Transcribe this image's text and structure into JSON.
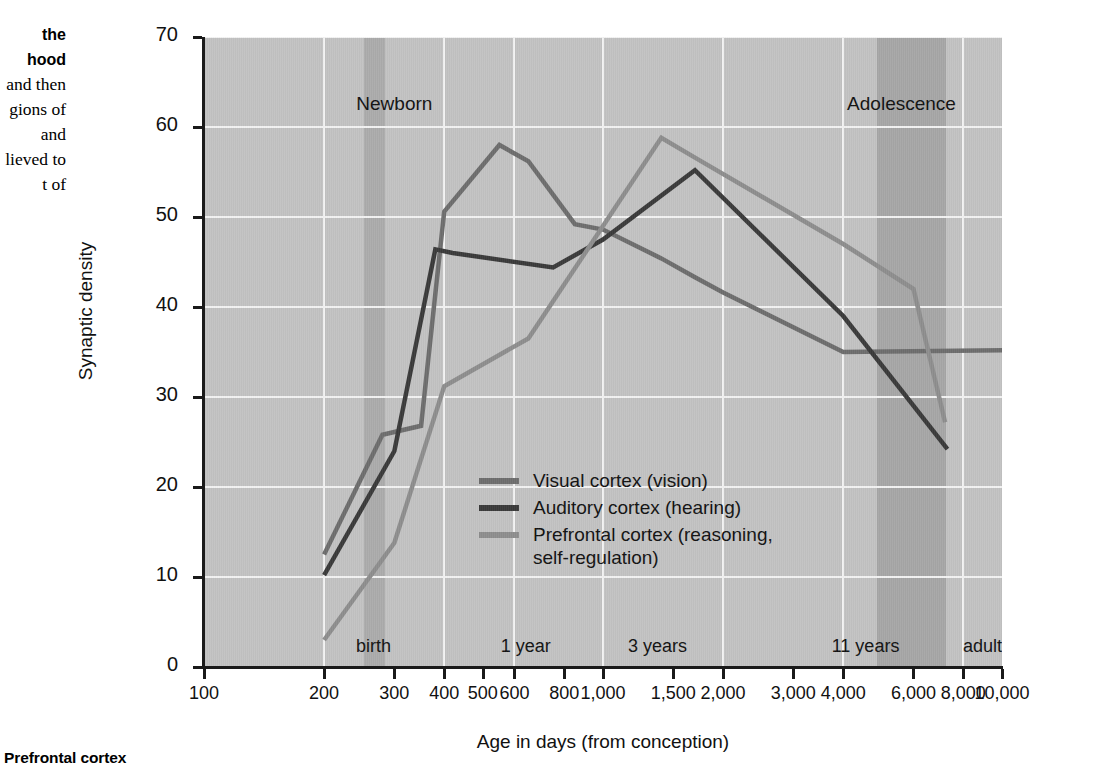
{
  "side_caption": {
    "bold_lines": [
      "the",
      "hood"
    ],
    "body_lines": [
      "and then",
      "gions of",
      "and",
      "lieved to",
      "t of"
    ]
  },
  "bottom_caption": "Prefrontal cortex",
  "axes": {
    "y_title": "Synaptic density",
    "x_title": "Age in days (from conception)",
    "y_ticks": [
      0,
      10,
      20,
      30,
      40,
      50,
      60,
      70
    ],
    "x_ticks": [
      "100",
      "200",
      "300",
      "400",
      "500",
      "600",
      "800",
      "1,000",
      "1,500",
      "2,000",
      "3,000",
      "4,000",
      "6,000",
      "8,000",
      "10,000"
    ],
    "x_tick_values": [
      100,
      200,
      300,
      400,
      500,
      600,
      800,
      1000,
      1500,
      2000,
      3000,
      4000,
      6000,
      8000,
      10000
    ]
  },
  "region_labels": [
    {
      "name": "newborn-label",
      "text": "Newborn",
      "day": 300,
      "top": 93
    },
    {
      "name": "adolescence-label",
      "text": "Adolescence",
      "day": 5600,
      "top": 93
    }
  ],
  "milestones": [
    {
      "name": "milestone-birth",
      "text": "birth",
      "day": 266
    },
    {
      "name": "milestone-1-year",
      "text": "1 year",
      "day": 640
    },
    {
      "name": "milestone-3-years",
      "text": "3 years",
      "day": 1370
    },
    {
      "name": "milestone-11-years",
      "text": "11 years",
      "day": 4550
    },
    {
      "name": "milestone-adult",
      "text": "adult",
      "day": 10000
    }
  ],
  "shaded_bands": [
    {
      "name": "birth-band",
      "from": 252,
      "to": 285,
      "color": "#ababab"
    },
    {
      "name": "adolescence-band",
      "from": 4850,
      "to": 7250,
      "color": "#a6a6a6"
    }
  ],
  "colors": {
    "plot_background": "#c2c2c2",
    "gridline": "#f2f2f2",
    "axis": "#1a1a1a",
    "visual": "#6d6d6d",
    "auditory": "#3a3a3a",
    "prefrontal": "#8d8d8d"
  },
  "legend": [
    {
      "name": "legend-visual",
      "label": "Visual cortex (vision)",
      "color": "#6d6d6d"
    },
    {
      "name": "legend-auditory",
      "label": "Auditory cortex (hearing)",
      "color": "#3a3a3a"
    },
    {
      "name": "legend-prefrontal",
      "label": "Prefrontal cortex (reasoning,\nself-regulation)",
      "color": "#8d8d8d"
    }
  ],
  "chart_data": {
    "type": "line",
    "title": "",
    "xlabel": "Age in days (from conception)",
    "ylabel": "Synaptic density",
    "xscale": "log",
    "xlim": [
      100,
      10000
    ],
    "ylim": [
      0,
      70
    ],
    "grid": true,
    "legend_position": "inside-center",
    "series": [
      {
        "name": "Visual cortex (vision)",
        "color": "#6d6d6d",
        "x": [
          200,
          280,
          350,
          400,
          550,
          650,
          850,
          1000,
          1400,
          1700,
          2000,
          4000,
          10000
        ],
        "y": [
          12.5,
          25.8,
          26.8,
          50.6,
          58.0,
          56.2,
          49.2,
          48.6,
          45.4,
          43.3,
          41.6,
          35.0,
          35.2
        ]
      },
      {
        "name": "Auditory cortex (hearing)",
        "color": "#3a3a3a",
        "x": [
          200,
          300,
          380,
          420,
          750,
          1000,
          1700,
          4000,
          7300
        ],
        "y": [
          10.2,
          24.0,
          46.4,
          46.0,
          44.4,
          47.5,
          55.2,
          39.0,
          24.2
        ]
      },
      {
        "name": "Prefrontal cortex (reasoning, self-regulation)",
        "color": "#8d8d8d",
        "x": [
          200,
          300,
          400,
          650,
          1000,
          1400,
          1700,
          4000,
          6000,
          7200
        ],
        "y": [
          3.0,
          13.8,
          31.2,
          36.5,
          49.0,
          58.8,
          56.6,
          47.0,
          42.0,
          27.2
        ]
      }
    ],
    "annotations": [
      {
        "text": "Newborn",
        "at_day": 300
      },
      {
        "text": "Adolescence",
        "at_day": 5600
      },
      {
        "text": "birth",
        "at_day": 266
      },
      {
        "text": "1 year",
        "at_day": 640
      },
      {
        "text": "3 years",
        "at_day": 1370
      },
      {
        "text": "11 years",
        "at_day": 4550
      },
      {
        "text": "adult",
        "at_day": 10000
      }
    ]
  }
}
